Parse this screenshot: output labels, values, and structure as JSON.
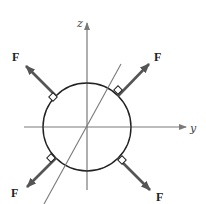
{
  "diagram": {
    "title": "",
    "axes": {
      "z": {
        "label": "z",
        "from": [
          87,
          190
        ],
        "to": [
          87,
          22
        ]
      },
      "y": {
        "label": "y",
        "from": [
          24,
          127
        ],
        "to": [
          185,
          127
        ]
      },
      "x": {
        "label": "",
        "from": [
          121,
          64
        ],
        "to": [
          44,
          204
        ]
      }
    },
    "sphere": {
      "center": [
        87,
        127
      ],
      "radius": 44
    },
    "forces": [
      {
        "id": "top-left",
        "label": "F",
        "direction_deg": 135,
        "label_pos": [
          14,
          61
        ]
      },
      {
        "id": "top-right",
        "label": "F",
        "direction_deg": 45,
        "label_pos": [
          155,
          61
        ]
      },
      {
        "id": "bottom-left",
        "label": "F",
        "direction_deg": 225,
        "label_pos": [
          13,
          197
        ]
      },
      {
        "id": "bottom-right",
        "label": "F",
        "direction_deg": 315,
        "label_pos": [
          157,
          201
        ]
      }
    ],
    "colors": {
      "axis": "#7a7a7a",
      "sphere": "#222222",
      "force": "#555555",
      "text": "#222222"
    }
  }
}
